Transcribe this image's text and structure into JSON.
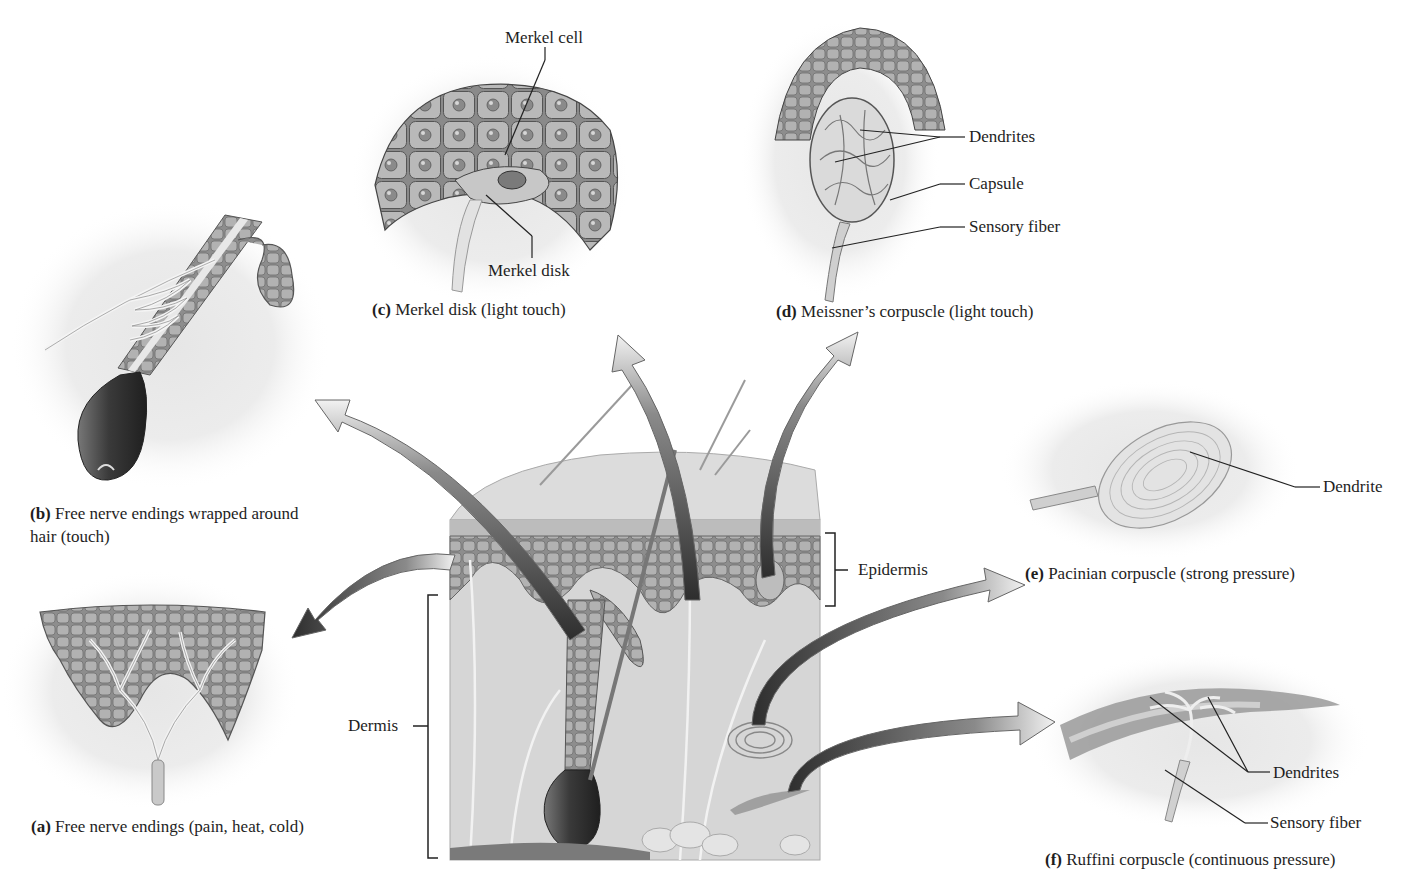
{
  "figure": {
    "layers": {
      "epidermis": "Epidermis",
      "dermis": "Dermis"
    },
    "panels": [
      {
        "id": "a",
        "letter": "(a)",
        "caption": "Free nerve endings (pain, heat, cold)",
        "labels": []
      },
      {
        "id": "b",
        "letter": "(b)",
        "caption": "Free nerve endings wrapped around hair (touch)",
        "labels": []
      },
      {
        "id": "c",
        "letter": "(c)",
        "caption": "Merkel disk (light touch)",
        "labels": [
          "Merkel cell",
          "Merkel disk"
        ]
      },
      {
        "id": "d",
        "letter": "(d)",
        "caption": "Meissner’s corpuscle (light touch)",
        "labels": [
          "Dendrites",
          "Capsule",
          "Sensory fiber"
        ]
      },
      {
        "id": "e",
        "letter": "(e)",
        "caption": "Pacinian corpuscle (strong pressure)",
        "labels": [
          "Dendrite"
        ]
      },
      {
        "id": "f",
        "letter": "(f)",
        "caption": "Ruffini corpuscle (continuous pressure)",
        "labels": [
          "Dendrites",
          "Sensory fiber"
        ]
      }
    ],
    "colors": {
      "background": "#ffffff",
      "tissue_light": "#d9d9d9",
      "tissue_mid": "#a8a8a8",
      "tissue_dark": "#5a5a5a",
      "arrow_dark": "#3c3c3c",
      "leader_line": "#222222"
    }
  }
}
